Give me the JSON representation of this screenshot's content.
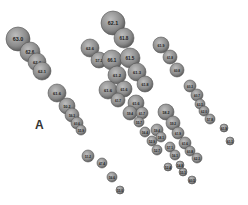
{
  "figure": {
    "panel_label": "A",
    "bubble_fill": "#8a8a8a",
    "bubble_edge": "#555555",
    "label_color": "#1a1a1a",
    "bubbles": [
      {
        "x": 18,
        "y": 39,
        "r": 12,
        "label": "63.0"
      },
      {
        "x": 30,
        "y": 52,
        "r": 10,
        "label": "62.6"
      },
      {
        "x": 37,
        "y": 62,
        "r": 9,
        "label": "62.2"
      },
      {
        "x": 42,
        "y": 71,
        "r": 9,
        "label": "62.1"
      },
      {
        "x": 57,
        "y": 93,
        "r": 9,
        "label": "61.6"
      },
      {
        "x": 67,
        "y": 106,
        "r": 8,
        "label": "50.2"
      },
      {
        "x": 72,
        "y": 115,
        "r": 7,
        "label": "56.3"
      },
      {
        "x": 77,
        "y": 123,
        "r": 6,
        "label": "60.6"
      },
      {
        "x": 81,
        "y": 130,
        "r": 5,
        "label": "55.9"
      },
      {
        "x": 88,
        "y": 156,
        "r": 6,
        "label": "51.2"
      },
      {
        "x": 102,
        "y": 163,
        "r": 5,
        "label": "47.4"
      },
      {
        "x": 112,
        "y": 177,
        "r": 5,
        "label": "56.6"
      },
      {
        "x": 120,
        "y": 190,
        "r": 4,
        "label": "55.0"
      },
      {
        "x": 113,
        "y": 23,
        "r": 12,
        "label": "62.1"
      },
      {
        "x": 124,
        "y": 38,
        "r": 10,
        "label": "61.8"
      },
      {
        "x": 90,
        "y": 48,
        "r": 9,
        "label": "62.6"
      },
      {
        "x": 99,
        "y": 60,
        "r": 8,
        "label": "57.2"
      },
      {
        "x": 112,
        "y": 60,
        "r": 10,
        "label": "66.1"
      },
      {
        "x": 130,
        "y": 58,
        "r": 10,
        "label": "61.5"
      },
      {
        "x": 117,
        "y": 75,
        "r": 9,
        "label": "61.2"
      },
      {
        "x": 137,
        "y": 72,
        "r": 9,
        "label": "61.3"
      },
      {
        "x": 108,
        "y": 90,
        "r": 9,
        "label": "61.6"
      },
      {
        "x": 124,
        "y": 89,
        "r": 8,
        "label": "61.6"
      },
      {
        "x": 145,
        "y": 84,
        "r": 8,
        "label": "61.8"
      },
      {
        "x": 118,
        "y": 100,
        "r": 7,
        "label": "61.7"
      },
      {
        "x": 136,
        "y": 103,
        "r": 8,
        "label": "61.6"
      },
      {
        "x": 130,
        "y": 113,
        "r": 7,
        "label": "59.4"
      },
      {
        "x": 142,
        "y": 113,
        "r": 6,
        "label": "61.7"
      },
      {
        "x": 139,
        "y": 122,
        "r": 5,
        "label": "55.7"
      },
      {
        "x": 161,
        "y": 45,
        "r": 8,
        "label": "61.9"
      },
      {
        "x": 170,
        "y": 57,
        "r": 7,
        "label": "61.8"
      },
      {
        "x": 177,
        "y": 70,
        "r": 7,
        "label": "60.8"
      },
      {
        "x": 190,
        "y": 86,
        "r": 6,
        "label": "60.3"
      },
      {
        "x": 197,
        "y": 95,
        "r": 6,
        "label": "60.7"
      },
      {
        "x": 200,
        "y": 104,
        "r": 5,
        "label": "63.5"
      },
      {
        "x": 204,
        "y": 111,
        "r": 5,
        "label": "62.0"
      },
      {
        "x": 210,
        "y": 119,
        "r": 5,
        "label": "57.8"
      },
      {
        "x": 166,
        "y": 112,
        "r": 8,
        "label": "58.2"
      },
      {
        "x": 173,
        "y": 123,
        "r": 7,
        "label": "59.2"
      },
      {
        "x": 178,
        "y": 133,
        "r": 6,
        "label": "61.9"
      },
      {
        "x": 185,
        "y": 143,
        "r": 6,
        "label": "61.6"
      },
      {
        "x": 190,
        "y": 151,
        "r": 5,
        "label": "60.8"
      },
      {
        "x": 197,
        "y": 158,
        "r": 5,
        "label": "62.3"
      },
      {
        "x": 224,
        "y": 128,
        "r": 4,
        "label": "61.9"
      },
      {
        "x": 230,
        "y": 141,
        "r": 4,
        "label": "61.1"
      },
      {
        "x": 145,
        "y": 132,
        "r": 5,
        "label": "56.4"
      },
      {
        "x": 152,
        "y": 141,
        "r": 5,
        "label": "52.9"
      },
      {
        "x": 157,
        "y": 150,
        "r": 5,
        "label": "52.7"
      },
      {
        "x": 157,
        "y": 130,
        "r": 6,
        "label": "59.4"
      },
      {
        "x": 161,
        "y": 137,
        "r": 5,
        "label": "58.1"
      },
      {
        "x": 170,
        "y": 147,
        "r": 5,
        "label": "57.1"
      },
      {
        "x": 175,
        "y": 155,
        "r": 5,
        "label": "56.1"
      },
      {
        "x": 180,
        "y": 165,
        "r": 4,
        "label": "54.8"
      },
      {
        "x": 183,
        "y": 172,
        "r": 4,
        "label": "55.1"
      },
      {
        "x": 168,
        "y": 167,
        "r": 4,
        "label": "52.4"
      },
      {
        "x": 192,
        "y": 180,
        "r": 4,
        "label": "60.5"
      }
    ]
  }
}
